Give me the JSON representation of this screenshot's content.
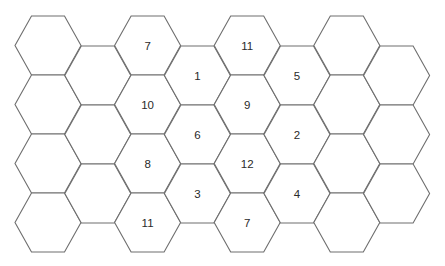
{
  "board": {
    "description": "Hexagonal tile board with number tokens",
    "colors": {
      "background": "#ffffff",
      "stroke": "#6e6e6e",
      "label": "#2a2a2a"
    },
    "geometry": {
      "origin_x": 15,
      "col_step": 49.8,
      "hex_width": 66,
      "hex_height": 59,
      "even_col_top": 16,
      "odd_col_top": 46
    },
    "columns": [
      {
        "col": 0,
        "tiles": [
          "",
          "",
          "",
          ""
        ]
      },
      {
        "col": 1,
        "tiles": [
          "",
          "",
          ""
        ]
      },
      {
        "col": 2,
        "tiles": [
          "7",
          "10",
          "8",
          "11"
        ]
      },
      {
        "col": 3,
        "tiles": [
          "1",
          "6",
          "3"
        ]
      },
      {
        "col": 4,
        "tiles": [
          "11",
          "9",
          "12",
          "7"
        ]
      },
      {
        "col": 5,
        "tiles": [
          "5",
          "2",
          "4"
        ]
      },
      {
        "col": 6,
        "tiles": [
          "",
          "",
          "",
          ""
        ]
      },
      {
        "col": 7,
        "tiles": [
          "",
          "",
          ""
        ]
      }
    ]
  }
}
